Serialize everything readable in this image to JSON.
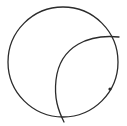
{
  "diagram": {
    "width": 127,
    "height": 126,
    "stroke_color": "#2b2b2b",
    "background": "#ffffff",
    "circle": {
      "cx": 63,
      "cy": 62,
      "r": 55,
      "stroke_width": 1.3
    },
    "arc": {
      "path": "M 119 37 C 90 34, 60 45, 56 80 C 54 98, 58 110, 64 122",
      "stroke_width": 1.3
    },
    "marker": {
      "cx": 110,
      "cy": 89,
      "r": 1.6
    }
  }
}
